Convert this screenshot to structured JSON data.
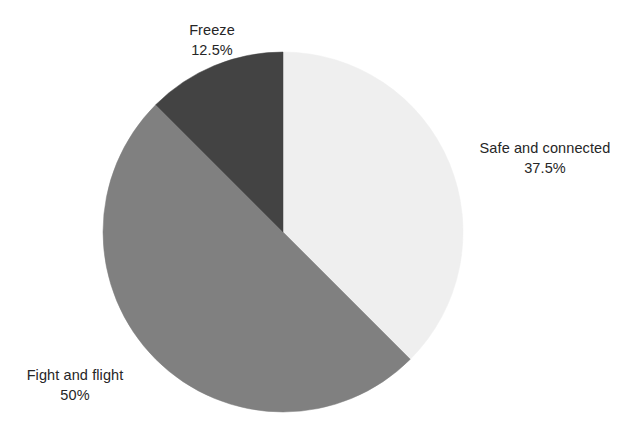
{
  "chart_data": {
    "type": "pie",
    "title": "",
    "subtitle": "",
    "xlabel": "",
    "ylabel": "",
    "legend_position": "none",
    "grid": false,
    "labels_outside": true,
    "start_angle_deg": 0,
    "direction": "clockwise",
    "categories": [
      "Safe and connected",
      "Fight and flight",
      "Freeze"
    ],
    "values": [
      37.5,
      50,
      12.5
    ],
    "value_unit": "percent",
    "slices": [
      {
        "label": "Safe and connected",
        "value": 37.5,
        "value_text": "37.5%",
        "color": "#efefef",
        "start_angle_deg": 0,
        "end_angle_deg": 135
      },
      {
        "label": "Fight and flight",
        "value": 50,
        "value_text": "50%",
        "color": "#808080",
        "start_angle_deg": 135,
        "end_angle_deg": 315
      },
      {
        "label": "Freeze",
        "value": 12.5,
        "value_text": "12.5%",
        "color": "#434343",
        "start_angle_deg": 315,
        "end_angle_deg": 360
      }
    ],
    "background_color": "#ffffff",
    "text_color": "#262626"
  },
  "labels": {
    "safe": {
      "name": "Safe and connected",
      "value": "37.5%"
    },
    "fight": {
      "name": "Fight and flight",
      "value": "50%"
    },
    "freeze": {
      "name": "Freeze",
      "value": "12.5%"
    }
  }
}
